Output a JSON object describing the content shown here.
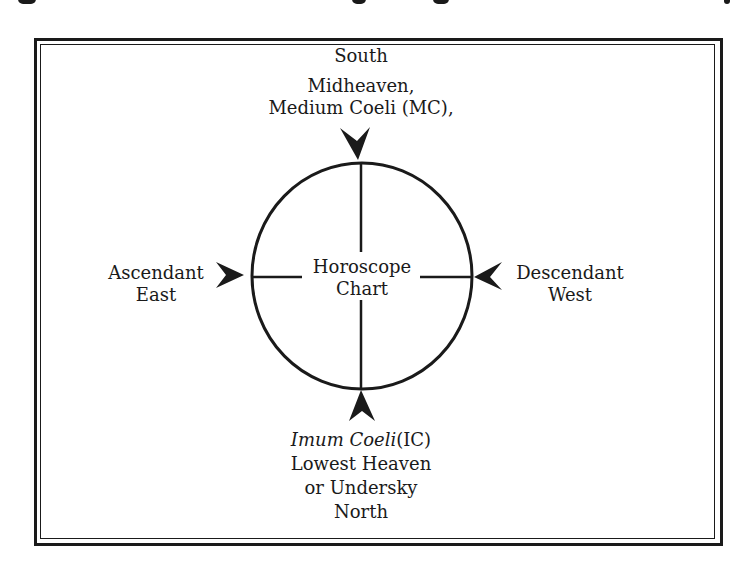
{
  "diagram": {
    "type": "horoscope-chart-axes",
    "center_label": {
      "line1": "Horoscope",
      "line2": "Chart"
    },
    "top": {
      "direction": "South",
      "line2": "Midheaven,",
      "line3": "Medium Coeli (MC),"
    },
    "left": {
      "line1": "Ascendant",
      "direction": "East"
    },
    "right": {
      "line1": "Descendant",
      "direction": "West"
    },
    "bottom": {
      "italic_part": "Imum Coeli",
      "abbr": "(IC)",
      "line2": "Lowest Heaven",
      "line3": "or Undersky",
      "direction": "North"
    },
    "colors": {
      "ink": "#1a1a1a",
      "background": "#ffffff"
    }
  }
}
